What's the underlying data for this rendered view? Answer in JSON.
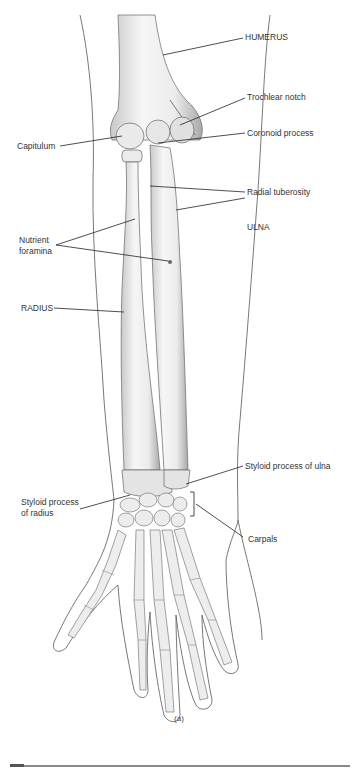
{
  "figure": {
    "caption": "(a)",
    "labels": {
      "humerus": "HUMERUS",
      "trochlear_notch": "Trochlear notch",
      "coronoid_process": "Coronoid process",
      "capitulum": "Capitulum",
      "radial_tuberosity": "Radial tuberosity",
      "ulna": "ULNA",
      "nutrient_foramina_line1": "Nutrient",
      "nutrient_foramina_line2": "foramina",
      "radius": "RADIUS",
      "styloid_ulna": "Styloid process of ulna",
      "styloid_radius_line1": "Styloid process",
      "styloid_radius_line2": "of radius",
      "carpals": "Carpals"
    },
    "colors": {
      "outline": "#555555",
      "bone_fill": "#f2f2f2",
      "bone_shade": "#b8b8b8",
      "leader": "#222222",
      "text": "#333333"
    }
  }
}
